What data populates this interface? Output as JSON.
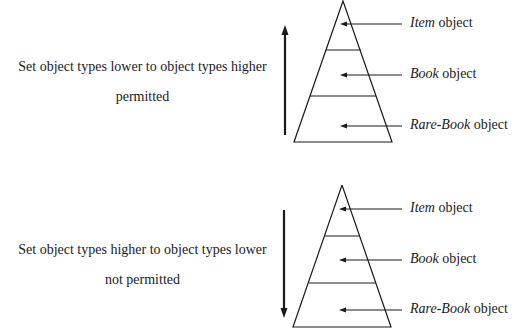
{
  "diagrams": [
    {
      "caption_line1": "Set object types lower to object types higher",
      "caption_line2": "permitted",
      "direction": "up",
      "levels": [
        {
          "name": "Item",
          "suffix": " object"
        },
        {
          "name": "Book",
          "suffix": " object"
        },
        {
          "name": "Rare-Book",
          "suffix": " object"
        }
      ]
    },
    {
      "caption_line1": "Set object types higher to object types lower",
      "caption_line2": "not permitted",
      "direction": "down",
      "levels": [
        {
          "name": "Item",
          "suffix": " object"
        },
        {
          "name": "Book",
          "suffix": " object"
        },
        {
          "name": "Rare-Book",
          "suffix": " object"
        }
      ]
    }
  ],
  "colors": {
    "line": "#1a1a1a",
    "background": "#ffffff"
  }
}
